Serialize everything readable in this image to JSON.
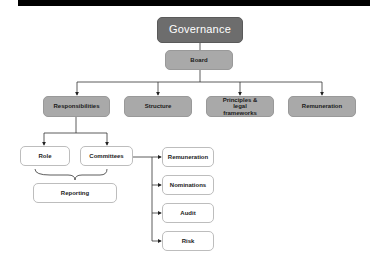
{
  "root": {
    "label": "Governance"
  },
  "board": {
    "label": "Board"
  },
  "level2": [
    {
      "label": "Responsibilities"
    },
    {
      "label": "Structure"
    },
    {
      "label": "Principles & legal frameworks"
    },
    {
      "label": "Remuneration"
    }
  ],
  "responsibilities_children": [
    {
      "label": "Role"
    },
    {
      "label": "Committees"
    }
  ],
  "reporting": {
    "label": "Reporting"
  },
  "committees": [
    {
      "label": "Remuneration"
    },
    {
      "label": "Nominations"
    },
    {
      "label": "Audit"
    },
    {
      "label": "Risk"
    }
  ],
  "colors": {
    "root": "#6d6d6d",
    "level": "#a9a9a9",
    "leaf": "#ffffff",
    "line": "#333333"
  }
}
